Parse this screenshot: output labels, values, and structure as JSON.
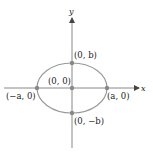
{
  "diagram": {
    "axes": {
      "x_label": "x",
      "y_label": "y",
      "color": "#888888"
    },
    "ellipse": {
      "stroke": "#999999",
      "center": [
        72,
        88
      ],
      "rx": 35,
      "ry": 25
    },
    "points": [
      {
        "id": "center",
        "label": "(0, 0)",
        "x": 72,
        "y": 88
      },
      {
        "id": "top",
        "label": "(0, b)",
        "x": 72,
        "y": 63
      },
      {
        "id": "bottom",
        "label": "(0, −b)",
        "x": 72,
        "y": 113
      },
      {
        "id": "left",
        "label": "(−a, 0)",
        "x": 37,
        "y": 88
      },
      {
        "id": "right",
        "label": "(a, 0)",
        "x": 107,
        "y": 88
      }
    ],
    "point_color": "#888888"
  }
}
